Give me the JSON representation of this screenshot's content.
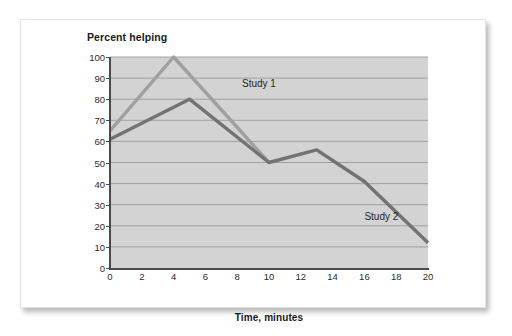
{
  "figure": {
    "title": "Percent helping",
    "xaxis_title": "Time, minutes"
  },
  "colors": {
    "plot_background": "#d3d3d3",
    "gridline": "#9a9a9a",
    "axis": "#4a4a4a",
    "study1_line": "#a0a0a0",
    "study2_line": "#737373",
    "text": "#1a1a1a",
    "card_background": "#ffffff",
    "page_background": "#ffffff"
  },
  "chart_data": {
    "type": "line",
    "title": "Percent helping",
    "xlabel": "Time, minutes",
    "ylabel": "Percent helping",
    "xlim": [
      0,
      20
    ],
    "ylim": [
      0,
      100
    ],
    "xticks": [
      0,
      2,
      4,
      6,
      8,
      10,
      12,
      14,
      16,
      18,
      20
    ],
    "yticks": [
      0,
      10,
      20,
      30,
      40,
      50,
      60,
      70,
      80,
      90,
      100
    ],
    "grid": "horizontal",
    "legend_position": "inline-annotation",
    "series": [
      {
        "name": "Study 1",
        "color": "#a0a0a0",
        "label_x": 8.3,
        "label_y": 87,
        "points": [
          {
            "x": 0,
            "y": 65
          },
          {
            "x": 4,
            "y": 100
          },
          {
            "x": 10,
            "y": 50
          }
        ]
      },
      {
        "name": "Study 2",
        "color": "#737373",
        "label_x": 16.0,
        "label_y": 24,
        "points": [
          {
            "x": 0,
            "y": 61
          },
          {
            "x": 5,
            "y": 80
          },
          {
            "x": 10,
            "y": 50
          },
          {
            "x": 13,
            "y": 56
          },
          {
            "x": 16,
            "y": 41
          },
          {
            "x": 20,
            "y": 12
          }
        ]
      }
    ]
  }
}
